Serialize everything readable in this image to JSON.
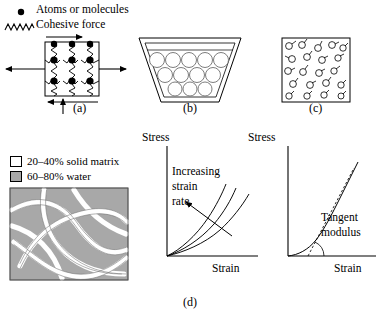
{
  "figure": {
    "caption_bottom": "(d)"
  },
  "legend_top": {
    "items": [
      {
        "marker": "filled-dot",
        "label": "Atoms or molecules"
      },
      {
        "marker": "zigzag-spring",
        "label": "Cohesive force"
      }
    ]
  },
  "legend_materials": {
    "items": [
      {
        "swatch_color": "#ffffff",
        "label": "20–40% solid matrix"
      },
      {
        "swatch_color": "#a8a8a8",
        "label": "60–80% water"
      }
    ]
  },
  "panels": [
    {
      "id": "a",
      "label": "(a)",
      "kind": "solid-lattice",
      "description": "Square solid element with 3x3 lattice of atoms joined by cohesive-force springs, loaded by external arrows",
      "grid_rows": 3,
      "grid_cols": 3,
      "arrows": [
        "left-tension",
        "right-tension",
        "top-shear-right",
        "bottom-shear-left",
        "bottom-compression-up"
      ]
    },
    {
      "id": "b",
      "label": "(b)",
      "kind": "liquid-in-container",
      "description": "Trapezoidal beaker holding loosely packed molecules that conform to the container",
      "circle_rows": [
        5,
        4,
        3
      ]
    },
    {
      "id": "c",
      "label": "(c)",
      "kind": "gas-in-box",
      "description": "Square box with widely separated molecules moving in random directions",
      "molecule_count": 20
    }
  ],
  "charts": [
    {
      "id": "strain-rate",
      "type": "line",
      "title": "",
      "xlabel": "Strain",
      "ylabel": "Stress",
      "grid": false,
      "legend": "none",
      "xlim": [
        0,
        1
      ],
      "ylim": [
        0,
        1
      ],
      "annotation": "Increasing\nstrain\nrate",
      "annotation_lines": [
        "Increasing",
        "strain",
        "rate"
      ],
      "annotation_arrow": "up-left",
      "series": [
        {
          "name": "low strain rate",
          "x": [
            0,
            0.12,
            0.25,
            0.4,
            0.55,
            0.7,
            0.82
          ],
          "y": [
            0,
            0.06,
            0.14,
            0.26,
            0.4,
            0.56,
            0.7
          ]
        },
        {
          "name": "medium strain rate",
          "x": [
            0,
            0.1,
            0.22,
            0.34,
            0.46,
            0.58,
            0.68
          ],
          "y": [
            0,
            0.07,
            0.17,
            0.31,
            0.46,
            0.62,
            0.76
          ]
        },
        {
          "name": "high strain rate",
          "x": [
            0,
            0.08,
            0.18,
            0.28,
            0.38,
            0.47,
            0.55
          ],
          "y": [
            0,
            0.08,
            0.2,
            0.36,
            0.52,
            0.68,
            0.8
          ]
        }
      ]
    },
    {
      "id": "tangent-modulus",
      "type": "line",
      "title": "",
      "xlabel": "Strain",
      "ylabel": "Stress",
      "grid": false,
      "legend": "none",
      "xlim": [
        0,
        1
      ],
      "ylim": [
        0,
        1
      ],
      "annotation_lines": [
        "Tangent",
        "modulus"
      ],
      "series": [
        {
          "name": "stress-strain curve",
          "x": [
            0,
            0.1,
            0.2,
            0.3,
            0.4,
            0.5,
            0.62,
            0.75
          ],
          "y": [
            0,
            0.02,
            0.07,
            0.16,
            0.31,
            0.48,
            0.66,
            0.84
          ]
        }
      ],
      "tangent_line": {
        "x": [
          0.22,
          0.78
        ],
        "y": [
          0.0,
          0.88
        ]
      },
      "angle_arc": true
    }
  ]
}
